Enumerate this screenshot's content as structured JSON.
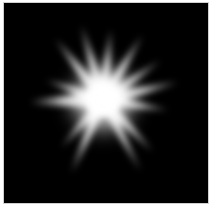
{
  "image": {
    "subject": "white starburst glow on black background",
    "background_color": "#000000",
    "border_color": "#cfcfcf",
    "glow_color": "#ffffff",
    "center": [
      100,
      98
    ],
    "rays": [
      {
        "to": [
          52,
          36
        ],
        "width": 12
      },
      {
        "to": [
          78,
          22
        ],
        "width": 11
      },
      {
        "to": [
          108,
          26
        ],
        "width": 11
      },
      {
        "to": [
          140,
          32
        ],
        "width": 11
      },
      {
        "to": [
          158,
          58
        ],
        "width": 10
      },
      {
        "to": [
          176,
          80
        ],
        "width": 12
      },
      {
        "to": [
          166,
          108
        ],
        "width": 11
      },
      {
        "to": [
          150,
          150
        ],
        "width": 11
      },
      {
        "to": [
          138,
          170
        ],
        "width": 10
      },
      {
        "to": [
          68,
          172
        ],
        "width": 11
      },
      {
        "to": [
          58,
          146
        ],
        "width": 10
      },
      {
        "to": [
          26,
          100
        ],
        "width": 16
      },
      {
        "to": [
          42,
          78
        ],
        "width": 10
      }
    ]
  }
}
